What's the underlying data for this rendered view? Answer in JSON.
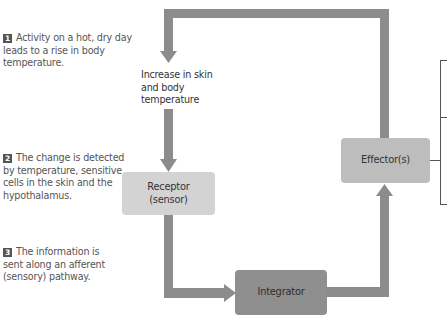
{
  "steps": [
    {
      "number": "1",
      "text": "Activity on a hot, dry day leads to a rise in body temperature."
    },
    {
      "number": "2",
      "text": "The change is detected by temperature, sensitive cells in the skin and the hypothalamus."
    },
    {
      "number": "3",
      "text": "The information is sent along an afferent (sensory) pathway."
    }
  ],
  "stimulus": {
    "line1": "Increase in skin",
    "line2": "and body",
    "line3": "temperature"
  },
  "boxes": {
    "receptor": {
      "line1": "Receptor",
      "line2": "(sensor)"
    },
    "integrator": {
      "label": "Integrator"
    },
    "effector": {
      "label": "Effector(s)"
    }
  },
  "colors": {
    "arrow": "#8c8c8c",
    "receptor_fill": "#d3d3d3",
    "integrator_fill": "#8f8f8f",
    "effector_fill": "#bdbdbd",
    "bracket": "#555555",
    "badge": "#555555"
  }
}
